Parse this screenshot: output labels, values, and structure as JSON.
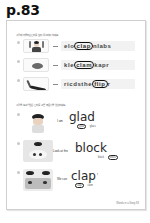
{
  "page": {
    "label": "p.83"
  },
  "exercise1": {
    "instruction": "그림에 어울리는 단어를 찾아 동그라미 하세요.",
    "items": [
      {
        "num": "1",
        "icon": "clapping-person-image",
        "prefix": "elo",
        "answer": "clap",
        "suffix": "nlabs"
      },
      {
        "num": "2",
        "icon": "clam-image",
        "prefix": "kle",
        "answer": "clam",
        "suffix": "kapr"
      },
      {
        "num": "3",
        "icon": "flip-image",
        "prefix": "ricdsthe",
        "answer": "flip",
        "suffix": "r"
      }
    ]
  },
  "exercise2": {
    "instruction": "그림을 보고 알맞은 단어를 고른 후 문장을 완성하세요.",
    "items": [
      {
        "num": "1",
        "icon": "glad-kid-image",
        "lead": "I am",
        "word": "glad",
        "end": ".",
        "choices": [
          "glad",
          "glass"
        ],
        "circled": 0
      },
      {
        "num": "2",
        "icon": "block-play-image",
        "lead": "Look at the",
        "word": "block",
        "end": ".",
        "choices": [
          "black",
          "block"
        ],
        "circled": 1
      },
      {
        "num": "3",
        "icon": "clapping-kids-image",
        "lead": "We can",
        "word": "clap",
        "end": "!",
        "choices": [
          "clap",
          "clam"
        ],
        "circled": 0
      }
    ]
  },
  "footer": {
    "text": "Words in a Story 83"
  }
}
